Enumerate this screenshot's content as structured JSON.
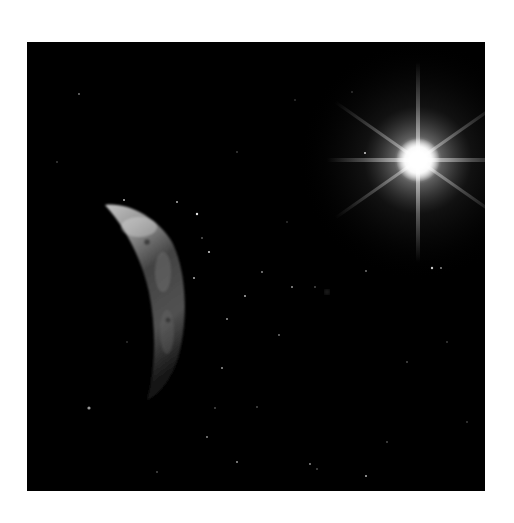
{
  "image": {
    "subject": "space scene",
    "alt": "Crescent planet on the left with a bright star flare in the upper right against a black star field",
    "background_color": "#ffffff",
    "frame_color": "#000000"
  },
  "elements": {
    "star": {
      "name": "bright-star",
      "cx": 391,
      "cy": 118,
      "color": "#ffffff"
    },
    "planet": {
      "name": "crescent-planet",
      "color": "#9a9a9a"
    }
  }
}
